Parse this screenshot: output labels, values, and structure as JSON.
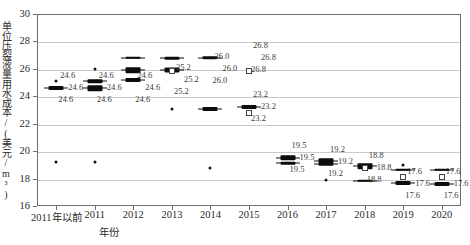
{
  "chart_data": {
    "type": "box",
    "title": "",
    "xlabel": "年份",
    "ylabel": "单位压裂液量用水成本/(美元/m³)",
    "ylim": [
      16,
      30
    ],
    "ytick_step": 2,
    "yticks": [
      "30",
      "28",
      "26",
      "24",
      "22",
      "20",
      "18",
      "16"
    ],
    "grid": true,
    "legend": "none",
    "categories": [
      "2011年以前",
      "2011",
      "2012",
      "2013",
      "2014",
      "2015",
      "2016",
      "2017",
      "2018",
      "2019",
      "2020"
    ],
    "groups": [
      {
        "category": "2011年以前",
        "median": 24.6,
        "labels": [
          "24.6",
          "24.6",
          "24.6"
        ],
        "boxes": [
          {
            "center": 24.6,
            "q1": 24.45,
            "q3": 24.75,
            "whisker_low": 24.3,
            "whisker_high": 24.9
          }
        ],
        "outliers": [
          25.1,
          19.2
        ]
      },
      {
        "category": "2011",
        "median": 24.6,
        "labels": [
          "24.6",
          "24.6",
          "24.6"
        ],
        "boxes": [
          {
            "center": 25.1,
            "q1": 25.0,
            "q3": 25.25,
            "whisker_low": 24.95,
            "whisker_high": 25.3
          },
          {
            "center": 24.6,
            "q1": 24.4,
            "q3": 24.8,
            "whisker_low": 24.25,
            "whisker_high": 24.95
          }
        ],
        "outliers": [
          26.0,
          19.2
        ]
      },
      {
        "category": "2012",
        "median": 24.6,
        "labels": [
          "24.6",
          "24.6",
          "24.6"
        ],
        "boxes": [
          {
            "center": 26.8,
            "q1": 26.72,
            "q3": 26.9,
            "whisker_low": 26.65,
            "whisker_high": 26.95
          },
          {
            "center": 25.9,
            "q1": 25.7,
            "q3": 26.1,
            "whisker_low": 25.55,
            "whisker_high": 26.2
          },
          {
            "center": 25.2,
            "q1": 25.05,
            "q3": 25.35,
            "whisker_low": 24.9,
            "whisker_high": 25.45
          }
        ],
        "outliers": []
      },
      {
        "category": "2013",
        "median": 25.2,
        "labels": [
          "25.2",
          "25.2",
          "25.2"
        ],
        "boxes": [
          {
            "center": 26.8,
            "q1": 26.7,
            "q3": 26.9,
            "whisker_low": 26.6,
            "whisker_high": 27.0
          },
          {
            "center": 25.9,
            "q1": 25.75,
            "q3": 26.1,
            "whisker_low": 25.6,
            "whisker_high": 26.2
          }
        ],
        "openboxes": [
          25.85
        ],
        "outliers": [
          23.05
        ]
      },
      {
        "category": "2014",
        "median": 26.0,
        "labels": [
          "26.0",
          "26.0",
          "26.0"
        ],
        "boxes": [
          {
            "center": 26.8,
            "q1": 26.68,
            "q3": 26.92,
            "whisker_low": 26.6,
            "whisker_high": 27.0
          },
          {
            "center": 23.05,
            "q1": 22.9,
            "q3": 23.2,
            "whisker_low": 22.8,
            "whisker_high": 23.3
          }
        ],
        "outliers": [
          18.75
        ]
      },
      {
        "category": "2015",
        "median": 26.8,
        "labels": [
          "26.8",
          "26.8",
          "26.8",
          "23.2",
          "23.2",
          "23.2"
        ],
        "boxes": [
          {
            "center": 23.2,
            "q1": 23.05,
            "q3": 23.35,
            "whisker_low": 22.9,
            "whisker_high": 23.5
          }
        ],
        "openboxes": [
          25.85,
          22.75
        ],
        "outliers": []
      },
      {
        "category": "2016",
        "median": 19.5,
        "labels": [
          "19.5",
          "19.5",
          "19.5"
        ],
        "boxes": [
          {
            "center": 19.5,
            "q1": 19.3,
            "q3": 19.7,
            "whisker_low": 19.15,
            "whisker_high": 19.85
          },
          {
            "center": 19.1,
            "q1": 19.0,
            "q3": 19.2,
            "whisker_low": 18.95,
            "whisker_high": 19.25
          }
        ],
        "outliers": []
      },
      {
        "category": "2017",
        "median": 19.2,
        "labels": [
          "19.2",
          "19.2",
          "19.2"
        ],
        "boxes": [
          {
            "center": 19.3,
            "q1": 19.1,
            "q3": 19.5,
            "whisker_low": 18.95,
            "whisker_high": 19.65
          },
          {
            "center": 19.05,
            "q1": 18.95,
            "q3": 19.15,
            "whisker_low": 18.9,
            "whisker_high": 19.2
          }
        ],
        "outliers": [
          17.9
        ]
      },
      {
        "category": "2018",
        "median": 18.8,
        "labels": [
          "18.8",
          "18.8",
          "18.8"
        ],
        "boxes": [
          {
            "center": 18.9,
            "q1": 18.7,
            "q3": 19.1,
            "whisker_low": 18.5,
            "whisker_high": 19.25
          },
          {
            "center": 17.85,
            "q1": 17.75,
            "q3": 17.95,
            "whisker_low": 17.7,
            "whisker_high": 18.0
          }
        ],
        "openboxes": [
          18.75
        ],
        "outliers": []
      },
      {
        "category": "2019",
        "median": 17.6,
        "labels": [
          "17.6",
          "17.6",
          "17.6"
        ],
        "boxes": [
          {
            "center": 18.65,
            "q1": 18.55,
            "q3": 18.75,
            "whisker_low": 18.5,
            "whisker_high": 18.8
          },
          {
            "center": 17.65,
            "q1": 17.5,
            "q3": 17.8,
            "whisker_low": 17.35,
            "whisker_high": 17.95
          }
        ],
        "openboxes": [
          18.15
        ],
        "outliers": [
          19.0
        ]
      },
      {
        "category": "2020",
        "median": 17.6,
        "labels": [
          "17.6",
          "17.6",
          "17.6"
        ],
        "boxes": [
          {
            "center": 18.65,
            "q1": 18.58,
            "q3": 18.72,
            "whisker_low": 18.55,
            "whisker_high": 18.75
          },
          {
            "center": 17.6,
            "q1": 17.45,
            "q3": 17.75,
            "whisker_low": 17.3,
            "whisker_high": 17.9
          }
        ],
        "openboxes": [
          18.1
        ],
        "outliers": []
      }
    ]
  }
}
